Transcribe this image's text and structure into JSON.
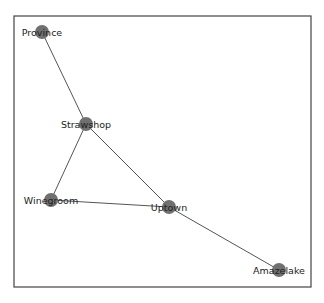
{
  "diagram": {
    "type": "network-graph",
    "frame": {
      "x": 14,
      "y": 16,
      "width": 297,
      "height": 271,
      "stroke": "#444444"
    },
    "style": {
      "node_color": "#707070",
      "node_radius": 7,
      "edge_color": "#555555",
      "label_color": "#222222"
    },
    "nodes": [
      {
        "id": "Province",
        "label": "Province",
        "x": 42,
        "y": 32
      },
      {
        "id": "Strawshop",
        "label": "Strawshop",
        "x": 86,
        "y": 124
      },
      {
        "id": "Winegroom",
        "label": "Winegroom",
        "x": 51,
        "y": 200
      },
      {
        "id": "Uptown",
        "label": "Uptown",
        "x": 169,
        "y": 207
      },
      {
        "id": "Amazelake",
        "label": "Amazelake",
        "x": 279,
        "y": 270
      }
    ],
    "edges": [
      {
        "source": "Province",
        "target": "Strawshop"
      },
      {
        "source": "Strawshop",
        "target": "Winegroom"
      },
      {
        "source": "Strawshop",
        "target": "Uptown"
      },
      {
        "source": "Winegroom",
        "target": "Uptown"
      },
      {
        "source": "Uptown",
        "target": "Amazelake"
      }
    ]
  }
}
